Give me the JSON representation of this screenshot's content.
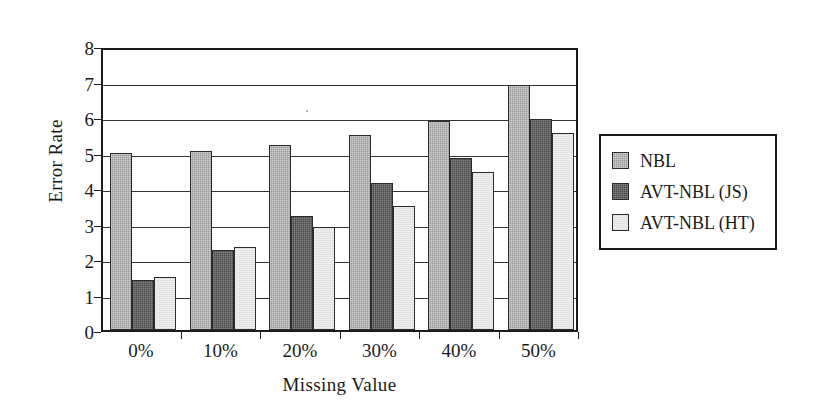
{
  "chart_data": {
    "type": "bar",
    "title": "",
    "xlabel": "Missing Value",
    "ylabel": "Error Rate",
    "categories": [
      "0%",
      "10%",
      "20%",
      "30%",
      "40%",
      "50%"
    ],
    "series": [
      {
        "name": "NBL",
        "values": [
          5.0,
          5.05,
          5.2,
          5.5,
          5.9,
          6.9
        ],
        "color": "#9b9b9b"
      },
      {
        "name": "AVT-NBL (JS)",
        "values": [
          1.4,
          2.25,
          3.2,
          4.15,
          4.85,
          5.95
        ],
        "color": "#4a4a4a"
      },
      {
        "name": "AVT-NBL (HT)",
        "values": [
          1.5,
          2.35,
          2.9,
          3.5,
          4.45,
          5.55
        ],
        "color": "#eeeeee"
      }
    ],
    "ylim": [
      0,
      8
    ],
    "yticks": [
      "0",
      "1",
      "2",
      "3",
      "4",
      "5",
      "6",
      "7",
      "8"
    ],
    "grid": true,
    "legend_position": "right"
  },
  "legend": {
    "items": [
      {
        "label": "NBL"
      },
      {
        "label": "AVT-NBL (JS)"
      },
      {
        "label": "AVT-NBL (HT)"
      }
    ]
  },
  "axes": {
    "y_title": "Error Rate",
    "x_title": "Missing Value"
  }
}
